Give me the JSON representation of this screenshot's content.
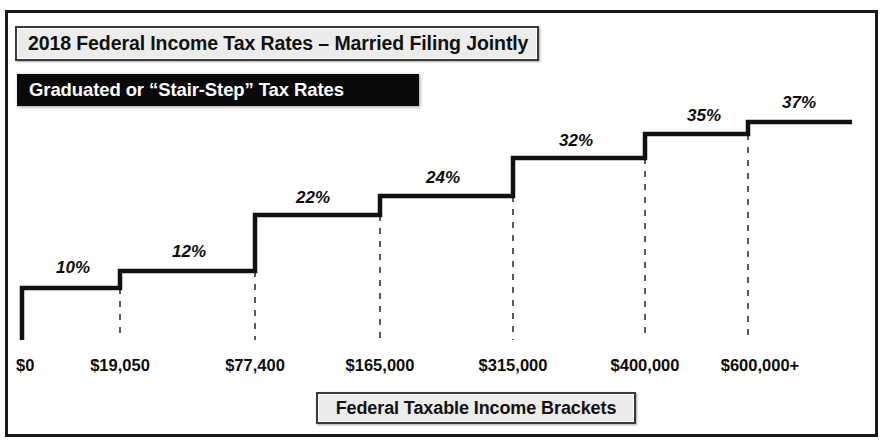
{
  "frame": {
    "accent_color": "#1a1a1a",
    "banner_fill": "#ececeb",
    "subtitle_fill": "#0a0a0a",
    "line_color": "#111111"
  },
  "header": {
    "title": "2018 Federal Income Tax Rates – Married Filing Jointly",
    "subtitle": "Graduated or “Stair-Step” Tax Rates"
  },
  "footer": {
    "axis_title": "Federal Taxable Income Brackets"
  },
  "chart_data": {
    "type": "line",
    "title": "2018 Federal Income Tax Rates – Married Filing Jointly",
    "subtitle": "Graduated or “Stair-Step” Tax Rates",
    "xlabel": "Federal Taxable Income Brackets",
    "ylabel": "",
    "grid": false,
    "legend": "none",
    "step_style": "stair-step / step-post",
    "categories": [
      "$0",
      "$19,050",
      "$77,400",
      "$165,000",
      "$315,000",
      "$400,000",
      "$600,000+"
    ],
    "bracket_thresholds": [
      0,
      19050,
      77400,
      165000,
      315000,
      400000,
      600000
    ],
    "values": [
      10,
      12,
      22,
      24,
      32,
      35,
      37
    ],
    "rate_labels": [
      "10%",
      "12%",
      "22%",
      "24%",
      "32%",
      "35%",
      "37%"
    ],
    "brackets": [
      {
        "label": "$0",
        "threshold": 0,
        "rate": 10,
        "rate_label": "10%",
        "x_px": 22,
        "plateau_y_px": 288
      },
      {
        "label": "$19,050",
        "threshold": 19050,
        "rate": 12,
        "rate_label": "12%",
        "x_px": 120,
        "plateau_y_px": 271
      },
      {
        "label": "$77,400",
        "threshold": 77400,
        "rate": 22,
        "rate_label": "22%",
        "x_px": 255,
        "plateau_y_px": 215
      },
      {
        "label": "$165,000",
        "threshold": 165000,
        "rate": 24,
        "rate_label": "24%",
        "x_px": 380,
        "plateau_y_px": 196
      },
      {
        "label": "$315,000",
        "threshold": 315000,
        "rate": 32,
        "rate_label": "32%",
        "x_px": 513,
        "plateau_y_px": 158
      },
      {
        "label": "$400,000",
        "threshold": 400000,
        "rate": 35,
        "rate_label": "35%",
        "x_px": 645,
        "plateau_y_px": 134
      },
      {
        "label": "$600,000+",
        "threshold": 600000,
        "rate": 37,
        "rate_label": "37%",
        "x_px": 748,
        "plateau_y_px": 122
      }
    ],
    "rate_label_positions": [
      {
        "text": "10%",
        "x_px": 73,
        "y_px": 258
      },
      {
        "text": "12%",
        "x_px": 189,
        "y_px": 242
      },
      {
        "text": "22%",
        "x_px": 313,
        "y_px": 188
      },
      {
        "text": "24%",
        "x_px": 443,
        "y_px": 168
      },
      {
        "text": "32%",
        "x_px": 576,
        "y_px": 131
      },
      {
        "text": "35%",
        "x_px": 704,
        "y_px": 106
      },
      {
        "text": "37%",
        "x_px": 799,
        "y_px": 93
      }
    ],
    "bracket_label_positions": [
      {
        "text": "$0",
        "x_px": 16,
        "y_px": 356,
        "centered": false
      },
      {
        "text": "$19,050",
        "x_px": 120,
        "y_px": 356,
        "centered": true
      },
      {
        "text": "$77,400",
        "x_px": 255,
        "y_px": 356,
        "centered": true
      },
      {
        "text": "$165,000",
        "x_px": 380,
        "y_px": 356,
        "centered": true
      },
      {
        "text": "$315,000",
        "x_px": 513,
        "y_px": 356,
        "centered": true
      },
      {
        "text": "$400,000",
        "x_px": 645,
        "y_px": 356,
        "centered": true
      },
      {
        "text": "$600,000+",
        "x_px": 760,
        "y_px": 356,
        "centered": true
      }
    ],
    "step_path": "M22,340 L22,288 L120,288 L120,271 L255,271 L255,215 L380,215 L380,196 L513,196 L513,158 L645,158 L645,134 L748,134 L748,122 L852,122",
    "dashed_guides": [
      {
        "x_px": 120,
        "y_top_px": 288,
        "y_bottom_px": 340
      },
      {
        "x_px": 255,
        "y_top_px": 271,
        "y_bottom_px": 340
      },
      {
        "x_px": 380,
        "y_top_px": 215,
        "y_bottom_px": 340
      },
      {
        "x_px": 513,
        "y_top_px": 196,
        "y_bottom_px": 340
      },
      {
        "x_px": 645,
        "y_top_px": 158,
        "y_bottom_px": 340
      },
      {
        "x_px": 748,
        "y_top_px": 134,
        "y_bottom_px": 340
      }
    ]
  }
}
